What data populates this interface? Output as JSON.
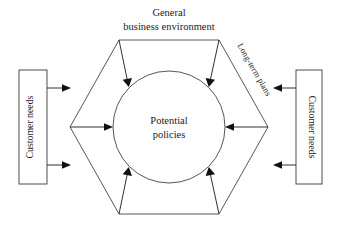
{
  "diagram": {
    "type": "hexagon-inputs-to-center",
    "background_color": "#ffffff",
    "line_color": "#2b2b2b",
    "center": {
      "shape": "circle",
      "line_1": "Potential",
      "line_2": "policies",
      "full_text": "Potential policies"
    },
    "top_label": {
      "line_1": "General",
      "line_2": "business environment",
      "full_text": "General business environment"
    },
    "diagonal_label": {
      "text": "Long-term plans",
      "position": "upper-right-edge",
      "rotation_deg": 60
    },
    "left_box": {
      "text": "Customer needs",
      "rotation_deg": -90,
      "arrow_count": 2,
      "arrow_direction": "right"
    },
    "right_box": {
      "text": "Customer needs",
      "rotation_deg": 90,
      "arrow_count": 2,
      "arrow_direction": "left"
    },
    "inward_arrows": [
      {
        "from_vertex": "top-left",
        "direction": "down-right"
      },
      {
        "from_vertex": "top-right",
        "direction": "down-left"
      },
      {
        "from_vertex": "left",
        "direction": "right"
      },
      {
        "from_vertex": "right",
        "direction": "left"
      },
      {
        "from_vertex": "bottom-left",
        "direction": "up-right"
      },
      {
        "from_vertex": "bottom-right",
        "direction": "up-left"
      }
    ]
  }
}
